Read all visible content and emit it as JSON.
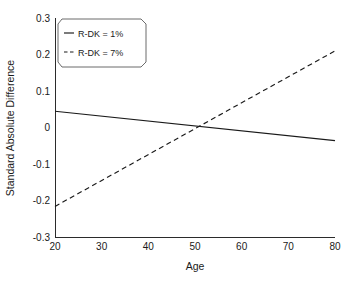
{
  "chart_data": {
    "type": "line",
    "title": "",
    "xlabel": "Age",
    "ylabel": "Standard Absolute Difference",
    "xlim": [
      20,
      80
    ],
    "ylim": [
      -0.3,
      0.3
    ],
    "xticks": [
      "20",
      "30",
      "40",
      "50",
      "60",
      "70",
      "80"
    ],
    "yticks": [
      "0.3",
      "0.2",
      "0.1",
      "0",
      "-0.1",
      "-0.2",
      "-0.3"
    ],
    "xtick_values": [
      20,
      30,
      40,
      50,
      60,
      70,
      80
    ],
    "ytick_values": [
      0.3,
      0.2,
      0.1,
      0,
      -0.1,
      -0.2,
      -0.3
    ],
    "grid": false,
    "legend_position": "top-left",
    "series": [
      {
        "name": "R-DK = 1%",
        "style": "solid",
        "color": "#1a1a1a",
        "x": [
          20,
          80
        ],
        "values": [
          0.045,
          -0.035
        ]
      },
      {
        "name": "R-DK = 7%",
        "style": "dashed",
        "color": "#1a1a1a",
        "x": [
          20,
          80
        ],
        "values": [
          -0.215,
          0.21
        ]
      }
    ]
  },
  "axes": {
    "x_title": "Age",
    "y_title": "Standard Absolute Difference",
    "x_tick_labels": [
      "20",
      "30",
      "40",
      "50",
      "60",
      "70",
      "80"
    ],
    "y_tick_labels": [
      "0.3",
      "0.2",
      "0.1",
      "0",
      "-0.1",
      "-0.2",
      "-0.3"
    ]
  },
  "legend": {
    "entries": [
      {
        "label": "R-DK = 1%",
        "style": "solid"
      },
      {
        "label": "R-DK = 7%",
        "style": "dashed"
      }
    ]
  }
}
